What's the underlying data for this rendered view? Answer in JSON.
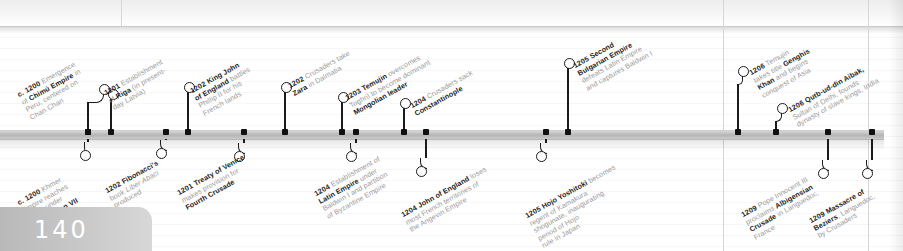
{
  "page": {
    "number": "140",
    "kind": "timeline-spread"
  },
  "timeline": {
    "bar_color": "#b5b5b5",
    "marker_color": "#111111",
    "entries_above": [
      {
        "year": "c. 1200",
        "lines": [
          {
            "text": "c. 1200 ",
            "bold": true
          },
          {
            "text": "Emergence"
          },
          {
            "text": "of "
          },
          {
            "text": "Chimú Empire",
            "bold": true
          },
          {
            "text": " in"
          },
          {
            "text": "Peru, centered on"
          },
          {
            "text": "Chan Chan"
          }
        ],
        "html": "<span class='ln'><span class='yr'>c. 1200</span> Emergence</span><span class='ln'>of <b>Chimú Empire</b> in</span><span class='ln'>Peru, centered on</span><span class='ln'>Chan Chan</span>",
        "marker_x": 88,
        "knob_x": 103,
        "knob_y": 88,
        "label_x": 16,
        "label_y": 92
      },
      {
        "year": "1201",
        "html": "<span class='ln'><span class='yr'>1201</span> Establishment</span><span class='ln'>of <b>Riga</b> (in present-</span><span class='ln'>day Latvia)</span>",
        "marker_x": 111,
        "knob_x": 112,
        "knob_y": 93,
        "label_x": 103,
        "label_y": 90
      },
      {
        "year": "1202",
        "html": "<span class='ln'><span class='yr'>1202</span> <b>King John</b></span><span class='ln'><b>of England</b> battles</span><span class='ln'>Phillip II for his</span><span class='ln'>French lands</span>",
        "marker_x": 188,
        "knob_x": 188,
        "knob_y": 86,
        "label_x": 189,
        "label_y": 88
      },
      {
        "year": "1202",
        "html": "<span class='ln'><span class='yr'>1202</span> Crusaders take</span><span class='ln'><b>Zara</b> in Dalmatia</span>",
        "marker_x": 285,
        "knob_x": 285,
        "knob_y": 86,
        "label_x": 287,
        "label_y": 83
      },
      {
        "year": "1203",
        "html": "<span class='ln'><span class='yr'>1203</span> <b>Temujin</b> overcomes</span><span class='ln'>Toghril to become dominant</span><span class='ln'><b>Mongolian leader</b></span>",
        "marker_x": 342,
        "knob_x": 342,
        "knob_y": 96,
        "label_x": 344,
        "label_y": 95
      },
      {
        "year": "1204",
        "html": "<span class='ln'><span class='yr'>1204</span> Crusaders sack</span><span class='ln'><b>Constantinople</b></span>",
        "marker_x": 404,
        "knob_x": 404,
        "knob_y": 102,
        "label_x": 409,
        "label_y": 103
      },
      {
        "year": "1205",
        "html": "<span class='ln'><span class='yr'>1205</span> <b>Second</b></span><span class='ln'><b>Bulgarian Empire</b></span><span class='ln'>defeats Latin Empire</span><span class='ln'>and captures Baldwin I</span>",
        "marker_x": 568,
        "knob_x": 568,
        "knob_y": 62,
        "label_x": 572,
        "label_y": 63
      },
      {
        "year": "1206",
        "html": "<span class='ln'><span class='yr'>1206</span> Temujin</span><span class='ln'>takes title <b>Genghis</b></span><span class='ln'><b>Khan</b> and begins</span><span class='ln'>conquest of Asia</span>",
        "marker_x": 738,
        "knob_x": 742,
        "knob_y": 70,
        "label_x": 748,
        "label_y": 70
      },
      {
        "year": "1206",
        "html": "<span class='ln'><span class='yr'>1206</span> <b>Qutb-ud-din Aibak,</b></span><span class='ln'>Sultan of Delhi, founds</span><span class='ln'>dynasty of slave kings, India</span>",
        "marker_x": 776,
        "knob_x": 781,
        "knob_y": 107,
        "label_x": 787,
        "label_y": 107
      }
    ],
    "entries_below": [
      {
        "year": "c. 1200",
        "html": "<span class='ln'><span class='yr'>c. 1200</span> Khmer</span><span class='ln'>Empire reaches</span><span class='ln'>height under</span><span class='ln'><b>Jayavarman VII</b></span>",
        "marker_x": 88,
        "knob_x": 84,
        "knob_y": 154,
        "label_x": 16,
        "label_y": 200
      },
      {
        "year": "1202",
        "html": "<span class='ln'><span class='yr'>1202</span> <b>Fibonacci's</b></span><span class='ln'>book <i>Liber Abaci</i></span><span class='ln'>produced</span>",
        "marker_x": 166,
        "knob_x": 160,
        "knob_y": 152,
        "label_x": 104,
        "label_y": 188
      },
      {
        "year": "1201",
        "html": "<span class='ln'><span class='yr'>1201</span> <b>Treaty of Venice</b></span><span class='ln'>makes provision for</span><span class='ln'><b>Fourth Crusade</b></span>",
        "marker_x": 244,
        "knob_x": 238,
        "knob_y": 155,
        "label_x": 176,
        "label_y": 190
      },
      {
        "year": "1204",
        "html": "<span class='ln'><span class='yr'>1204</span> Establishment of</span><span class='ln'><b>Latin Empire</b> under</span><span class='ln'>Baldwin I and partition</span><span class='ln'>of Byzantine Empire</span>",
        "marker_x": 356,
        "knob_x": 350,
        "knob_y": 155,
        "label_x": 313,
        "label_y": 191
      },
      {
        "year": "1204",
        "html": "<span class='ln'><span class='yr'>1204</span> <b>John of England</b> loses</span><span class='ln'>most French territories of</span><span class='ln'>the Angevin Empire</span>",
        "marker_x": 426,
        "knob_x": 420,
        "knob_y": 170,
        "label_x": 400,
        "label_y": 212
      },
      {
        "year": "1205",
        "html": "<span class='ln'><span class='yr'>1205</span> <b>Hojo Yoshitoki</b> becomes</span><span class='ln'>regent of Kamakura</span><span class='ln'>shogunate, inaugurating</span><span class='ln'>period of Hojo</span><span class='ln'>rule in Japan</span>",
        "marker_x": 546,
        "knob_x": 540,
        "knob_y": 155,
        "label_x": 524,
        "label_y": 213
      },
      {
        "year": "1209",
        "html": "<span class='ln'><span class='yr'>1209</span> Pope Innocent III</span><span class='ln'>proclaims <b>Albigensian</b></span><span class='ln'><b>Crusade</b> in Languedoc,</span><span class='ln'>France</span>",
        "marker_x": 828,
        "knob_x": 822,
        "knob_y": 172,
        "label_x": 740,
        "label_y": 212
      },
      {
        "year": "1209",
        "html": "<span class='ln'><span class='yr'>1209</span> <b>Massacre of</b></span><span class='ln'><b>Beziers</b>, Languedoc,</span><span class='ln'>by Crusaders</span>",
        "marker_x": 872,
        "knob_x": 866,
        "knob_y": 172,
        "label_x": 808,
        "label_y": 218
      }
    ],
    "column_rules_x": [
      723,
      868
    ],
    "short_rules_x": [
      121,
      723
    ]
  }
}
